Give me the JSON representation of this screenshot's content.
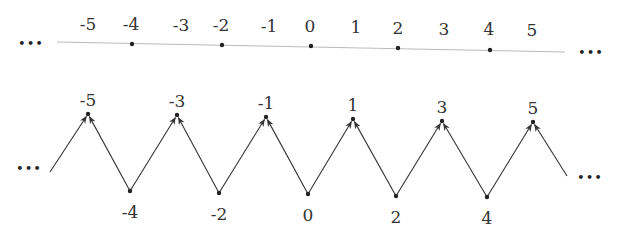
{
  "number_line": {
    "ellipsis_left": "•••",
    "ellipsis_right": "•••",
    "labels": [
      {
        "text": "-5",
        "x": 88,
        "y": 30
      },
      {
        "text": "-4",
        "x": 131,
        "y": 30
      },
      {
        "text": "-3",
        "x": 181,
        "y": 31
      },
      {
        "text": "-2",
        "x": 221,
        "y": 31
      },
      {
        "text": "-1",
        "x": 269,
        "y": 32
      },
      {
        "text": "0",
        "x": 310,
        "y": 32
      },
      {
        "text": "1",
        "x": 356,
        "y": 33
      },
      {
        "text": "2",
        "x": 398,
        "y": 34
      },
      {
        "text": "3",
        "x": 444,
        "y": 35
      },
      {
        "text": "4",
        "x": 489,
        "y": 35
      },
      {
        "text": "5",
        "x": 532,
        "y": 36
      }
    ],
    "dots": [
      {
        "value": "-4",
        "x": 132,
        "y": 44
      },
      {
        "value": "-2",
        "x": 222,
        "y": 45
      },
      {
        "value": "0",
        "x": 311,
        "y": 46
      },
      {
        "value": "2",
        "x": 398,
        "y": 48
      },
      {
        "value": "4",
        "x": 490,
        "y": 50
      }
    ]
  },
  "zigzag": {
    "ellipsis_left": "•••",
    "ellipsis_right": "•••",
    "start": {
      "x": 50,
      "y": 172
    },
    "end": {
      "x": 567,
      "y": 176
    },
    "peaks": [
      {
        "text": "-5",
        "x": 88,
        "y": 114
      },
      {
        "text": "-3",
        "x": 177,
        "y": 115
      },
      {
        "text": "-1",
        "x": 266,
        "y": 117
      },
      {
        "text": "1",
        "x": 353,
        "y": 119
      },
      {
        "text": "3",
        "x": 442,
        "y": 121
      },
      {
        "text": "5",
        "x": 533,
        "y": 122
      }
    ],
    "valleys": [
      {
        "text": "-4",
        "x": 130,
        "y": 191
      },
      {
        "text": "-2",
        "x": 219,
        "y": 193
      },
      {
        "text": "0",
        "x": 308,
        "y": 194
      },
      {
        "text": "2",
        "x": 396,
        "y": 196
      },
      {
        "text": "4",
        "x": 487,
        "y": 197
      }
    ]
  }
}
